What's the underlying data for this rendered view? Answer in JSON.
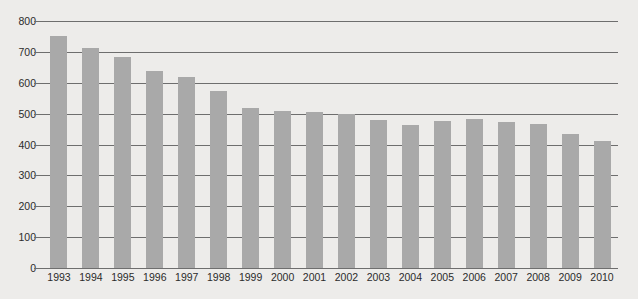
{
  "chart_data": {
    "type": "bar",
    "title": "",
    "subtitle": "",
    "xlabel": "",
    "ylabel": "",
    "ylim": [
      0,
      800
    ],
    "ytick_labels": [
      "800",
      "700",
      "600",
      "500",
      "400",
      "300",
      "200",
      "100",
      "0"
    ],
    "ytick_values": [
      800,
      700,
      600,
      500,
      400,
      300,
      200,
      100,
      0
    ],
    "grid": true,
    "legend": "none",
    "categories": [
      "1993",
      "1994",
      "1995",
      "1996",
      "1997",
      "1998",
      "1999",
      "2000",
      "2001",
      "2002",
      "2003",
      "2004",
      "2005",
      "2006",
      "2007",
      "2008",
      "2009",
      "2010"
    ],
    "values": [
      750,
      714,
      684,
      638,
      618,
      574,
      519,
      508,
      506,
      498,
      479,
      463,
      475,
      482,
      473,
      466,
      434,
      410
    ],
    "series": [
      {
        "name": "",
        "values": [
          750,
          714,
          684,
          638,
          618,
          574,
          519,
          508,
          506,
          498,
          479,
          463,
          475,
          482,
          473,
          466,
          434,
          410
        ]
      }
    ],
    "colors": {
      "bar": "#a9a9a9",
      "gridline": "#6e6e6e",
      "background": "#edecea",
      "text": "#2b2b2b"
    }
  }
}
